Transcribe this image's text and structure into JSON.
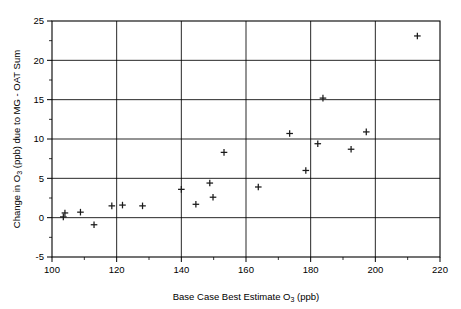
{
  "chart_data": {
    "type": "scatter",
    "title": "",
    "xlabel": "Base Case Best Estimate O3 (ppb)",
    "xlabel_parts": {
      "pre": "Base Case Best Estimate O",
      "sub": "3",
      "post": " (ppb)"
    },
    "ylabel": "Change in O3 (ppb) due to MG - OAT Sum",
    "ylabel_parts": {
      "pre": "Change in O",
      "sub": "3",
      "post": " (ppb) due to MG - OAT Sum"
    },
    "xlim": [
      100,
      220
    ],
    "ylim": [
      -5,
      25
    ],
    "xticks": [
      100,
      120,
      140,
      160,
      180,
      200,
      220
    ],
    "yticks": [
      -5,
      0,
      5,
      10,
      15,
      20,
      25
    ],
    "xtick_labels": [
      "100",
      "120",
      "140",
      "160",
      "180",
      "200",
      "220"
    ],
    "ytick_labels": [
      "-5",
      "0",
      "5",
      "10",
      "15",
      "20",
      "25"
    ],
    "x_minor_interval": 10,
    "y_minor_interval": 2.5,
    "grid": true,
    "grid_axis": "both",
    "legend": "none",
    "marker": "plus",
    "marker_color": "#1a1a1a",
    "points": [
      {
        "x": 103.5,
        "y": 0.1
      },
      {
        "x": 104.0,
        "y": 0.6
      },
      {
        "x": 108.8,
        "y": 0.7
      },
      {
        "x": 113.0,
        "y": -0.9
      },
      {
        "x": 118.5,
        "y": 1.5
      },
      {
        "x": 121.8,
        "y": 1.6
      },
      {
        "x": 128.0,
        "y": 1.5
      },
      {
        "x": 140.0,
        "y": 3.6
      },
      {
        "x": 144.5,
        "y": 1.7
      },
      {
        "x": 148.8,
        "y": 4.4
      },
      {
        "x": 149.8,
        "y": 2.6
      },
      {
        "x": 153.2,
        "y": 8.3
      },
      {
        "x": 163.8,
        "y": 3.9
      },
      {
        "x": 173.5,
        "y": 10.7
      },
      {
        "x": 178.5,
        "y": 6.0
      },
      {
        "x": 182.2,
        "y": 9.4
      },
      {
        "x": 183.8,
        "y": 15.2
      },
      {
        "x": 192.5,
        "y": 8.7
      },
      {
        "x": 197.2,
        "y": 10.9
      },
      {
        "x": 213.0,
        "y": 23.1
      }
    ]
  },
  "plot_geometry": {
    "left": 52,
    "right": 440,
    "top": 21,
    "bottom": 257
  }
}
